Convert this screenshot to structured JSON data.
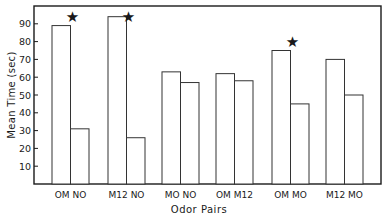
{
  "chart_data": {
    "type": "bar",
    "title": "",
    "xlabel": "Odor Pairs",
    "ylabel": "Mean Time (sec)",
    "ylim": [
      0,
      100
    ],
    "yticks": [
      10,
      20,
      30,
      40,
      50,
      60,
      70,
      80,
      90
    ],
    "grid": false,
    "legend": null,
    "groups": [
      {
        "label": "OM  NO",
        "bars": [
          {
            "odor": "OM",
            "value": 89
          },
          {
            "odor": "NO",
            "value": 31
          }
        ],
        "significant": true
      },
      {
        "label": "M12  NO",
        "bars": [
          {
            "odor": "M12",
            "value": 94
          },
          {
            "odor": "NO",
            "value": 26
          }
        ],
        "significant": true
      },
      {
        "label": "MO  NO",
        "bars": [
          {
            "odor": "MO",
            "value": 63
          },
          {
            "odor": "NO",
            "value": 57
          }
        ],
        "significant": false
      },
      {
        "label": "OM  M12",
        "bars": [
          {
            "odor": "OM",
            "value": 62
          },
          {
            "odor": "M12",
            "value": 58
          }
        ],
        "significant": false
      },
      {
        "label": "OM  MO",
        "bars": [
          {
            "odor": "OM",
            "value": 75
          },
          {
            "odor": "MO",
            "value": 45
          }
        ],
        "significant": true
      },
      {
        "label": "M12  MO",
        "bars": [
          {
            "odor": "M12",
            "value": 70
          },
          {
            "odor": "MO",
            "value": 50
          }
        ],
        "significant": false
      }
    ],
    "categories": [
      "OM NO",
      "M12 NO",
      "MO NO",
      "OM M12",
      "OM MO",
      "M12 MO"
    ],
    "series": [
      {
        "name": "First odor of pair",
        "values": [
          89,
          94,
          63,
          62,
          75,
          70
        ]
      },
      {
        "name": "Second odor of pair",
        "values": [
          31,
          26,
          57,
          58,
          45,
          50
        ]
      }
    ],
    "annotations": [
      {
        "symbol": "★",
        "group": "OM NO",
        "meaning": "significant difference"
      },
      {
        "symbol": "★",
        "group": "M12 NO",
        "meaning": "significant difference"
      },
      {
        "symbol": "★",
        "group": "OM MO",
        "meaning": "significant difference"
      }
    ]
  },
  "colors": {
    "axis": "#1a1a1a",
    "bar_fill": "#ffffff",
    "bar_stroke": "#333333",
    "background": "#ffffff"
  },
  "layout": {
    "frame": {
      "x": 34,
      "y": 6,
      "w": 347,
      "h": 178
    },
    "group_x": [
      52,
      108,
      162,
      216,
      272,
      326
    ],
    "bar_width": 18.5
  }
}
